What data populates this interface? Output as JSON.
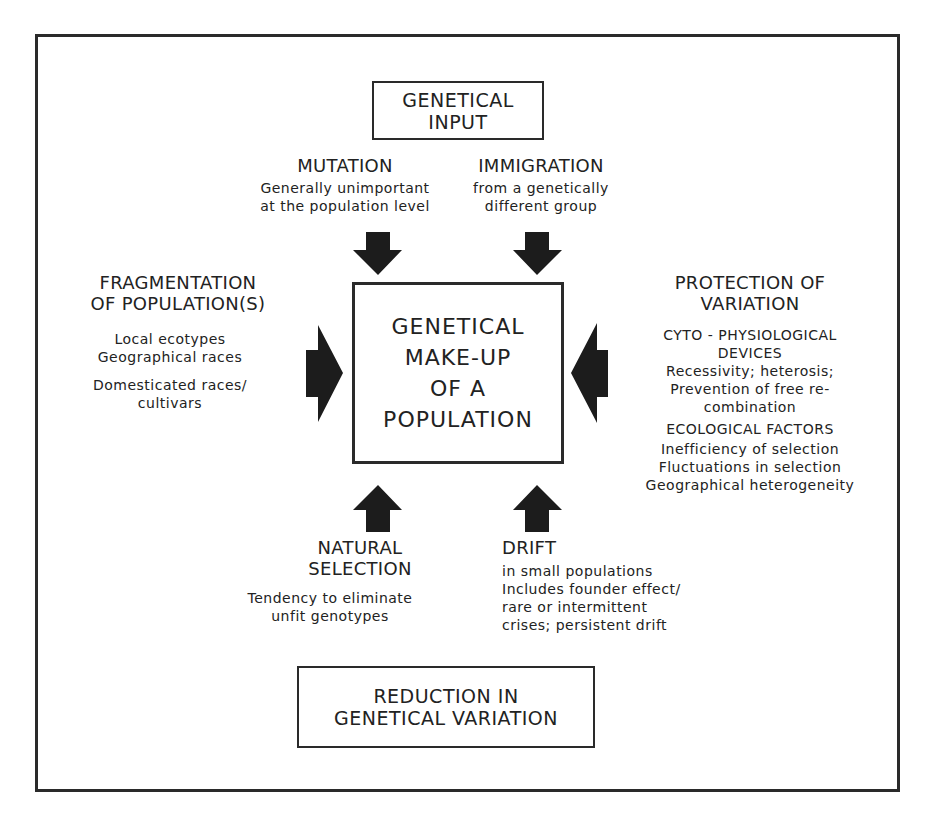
{
  "diagram": {
    "colors": {
      "ink": "#222222",
      "arrow": "#1c1c1c",
      "background": "#ffffff"
    },
    "input_box": {
      "lines": [
        "GENETICAL",
        "INPUT"
      ]
    },
    "center_box": {
      "lines": [
        "GENETICAL",
        "MAKE-UP",
        "OF A",
        "POPULATION"
      ]
    },
    "output_box": {
      "lines": [
        "REDUCTION IN",
        "GENETICAL VARIATION"
      ]
    },
    "mutation": {
      "title": "MUTATION",
      "lines": [
        "Generally unimportant",
        "at the population level"
      ],
      "arrow": "arrow-down-icon"
    },
    "immigration": {
      "title": "IMMIGRATION",
      "lines": [
        "from a genetically",
        "different group"
      ],
      "arrow": "arrow-down-icon"
    },
    "fragmentation": {
      "title_lines": [
        "FRAGMENTATION",
        "OF POPULATION(S)"
      ],
      "group1": [
        "Local ecotypes",
        "Geographical races"
      ],
      "group2": [
        "Domesticated races/",
        "cultivars"
      ],
      "arrow": "arrow-right-icon"
    },
    "protection": {
      "title_lines": [
        "PROTECTION OF",
        "VARIATION"
      ],
      "section1_title": [
        "CYTO - PHYSIOLOGICAL",
        "DEVICES"
      ],
      "section1_lines": [
        "Recessivity;  heterosis;",
        "Prevention of free re-",
        "combination"
      ],
      "section2_title": "ECOLOGICAL FACTORS",
      "section2_lines": [
        "Inefficiency of selection",
        "Fluctuations in selection",
        "Geographical heterogeneity"
      ],
      "arrow": "arrow-left-icon"
    },
    "natural_selection": {
      "title_lines": [
        "NATURAL",
        "SELECTION"
      ],
      "lines": [
        "Tendency to eliminate",
        "unfit genotypes"
      ],
      "arrow": "arrow-up-icon"
    },
    "drift": {
      "title": "DRIFT",
      "lines": [
        "in small populations",
        "Includes founder effect/",
        "rare or intermittent",
        "crises; persistent drift"
      ],
      "arrow": "arrow-up-icon"
    }
  }
}
